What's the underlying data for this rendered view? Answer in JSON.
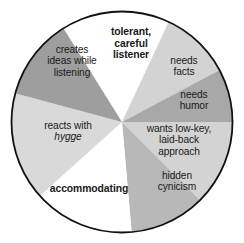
{
  "figure": {
    "type": "segmented-circle-diagram",
    "background_color": "#ffffff",
    "outline_color": "#111111",
    "text_color": "#1a1a1a"
  },
  "chart_data": {
    "type": "pie",
    "title": "",
    "subtitle": "",
    "xlabel": "",
    "ylabel": "",
    "legend_position": "none",
    "grid": false,
    "center": {
      "x": 122,
      "y": 122
    },
    "radius": 110,
    "categories": [
      "tolerant, careful listener",
      "needs facts",
      "needs humor",
      "wants low-key, laid-back approach",
      "hidden cynicism",
      "accommodating",
      "reacts with hygge",
      "creates ideas while listening"
    ],
    "values": [
      57,
      37,
      28,
      45,
      40,
      53,
      57,
      43
    ],
    "colors": [
      "#ffffff",
      "#d3d3d3",
      "#a8a8a8",
      "#d3d3d3",
      "#b8b8b8",
      "#ffffff",
      "#d9d9d9",
      "#9e9e9e"
    ],
    "start_angles_deg": [
      -32,
      25,
      62,
      90,
      135,
      175,
      228,
      285
    ],
    "end_angles_deg": [
      25,
      62,
      90,
      135,
      175,
      228,
      285,
      328
    ]
  },
  "segments": [
    {
      "id": "tolerant-careful-listener",
      "style": "bold",
      "color": "#ffffff",
      "lines": [
        "tolerant,",
        "careful",
        "listener"
      ]
    },
    {
      "id": "needs-facts",
      "style": "normal",
      "color": "#d3d3d3",
      "lines": [
        "needs",
        "facts"
      ]
    },
    {
      "id": "needs-humor",
      "style": "normal",
      "color": "#a8a8a8",
      "lines": [
        "needs",
        "humor"
      ]
    },
    {
      "id": "wants-low-key-laid-back-approach",
      "style": "normal",
      "color": "#d3d3d3",
      "lines": [
        "wants low-key,",
        "laid-back",
        "approach"
      ]
    },
    {
      "id": "hidden-cynicism",
      "style": "normal",
      "color": "#b8b8b8",
      "lines": [
        "hidden",
        "cynicism"
      ]
    },
    {
      "id": "accommodating",
      "style": "bold",
      "color": "#ffffff",
      "lines": [
        "accommodating"
      ]
    },
    {
      "id": "reacts-with-hygge",
      "style": "normal",
      "color": "#d9d9d9",
      "lines": [
        "reacts with",
        "hygge"
      ],
      "italic_line_index": 1
    },
    {
      "id": "creates-ideas-while-listening",
      "style": "normal",
      "color": "#9e9e9e",
      "lines": [
        "creates",
        "ideas while",
        "listening"
      ]
    }
  ]
}
